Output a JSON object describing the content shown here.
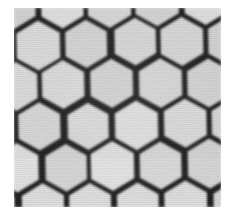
{
  "image": {
    "kind": "micrograph",
    "subject": "hexagonal honeycomb lattice",
    "width": 225,
    "height": 213,
    "alt_text": "Grayscale micrograph of a hexagonal honeycomb lattice with dark cell walls and light cell interiors",
    "caption": ""
  },
  "frame": {
    "background_color": "#ffffff",
    "margin_left": 14,
    "margin_top": 8,
    "margin_right": 4,
    "margin_bottom": 6,
    "content_width": 207,
    "content_height": 199
  },
  "appearance": {
    "cell_fill_color": "#d9d9d9",
    "cell_fill_color_light": "#e2e2e2",
    "wall_color": "#1e1e1e",
    "wall_color_soft": "#3a3a3a",
    "background_color": "#ffffff",
    "wall_thickness_px": 5.4,
    "wall_blur_px": 1.1,
    "grain_opacity": 0.5,
    "rotation_deg": -1.2
  },
  "lattice": {
    "orientation": "pointy-top",
    "horizontal_pitch_px": 48,
    "vertical_pitch_px": 41,
    "row_offset_px": 24,
    "circumradius_px": 27,
    "columns": 5,
    "rows": 6,
    "origin_x_px": 2,
    "origin_y_px": -6
  }
}
